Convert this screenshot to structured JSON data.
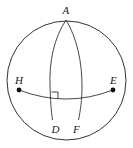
{
  "diagram": {
    "type": "spherical-geometry",
    "sphere": {
      "cx": 66.5,
      "cy": 80.5,
      "r": 59.5
    },
    "points": {
      "A": {
        "label": "A",
        "x": 66,
        "y": 20
      },
      "H": {
        "label": "H",
        "x": 19,
        "y": 90
      },
      "E": {
        "label": "E",
        "x": 113,
        "y": 90
      },
      "D": {
        "label": "D",
        "x": 52,
        "y": 120
      },
      "F": {
        "label": "F",
        "x": 78,
        "y": 120
      }
    },
    "labels": {
      "A": "A",
      "H": "H",
      "E": "E",
      "D": "D",
      "F": "F"
    },
    "arcs": [
      {
        "name": "arc-A-D",
        "from": "A",
        "to": "D"
      },
      {
        "name": "arc-A-F",
        "from": "A",
        "to": "F"
      },
      {
        "name": "arc-H-E",
        "from": "H",
        "to": "E"
      }
    ],
    "right_angle_marker": {
      "at": "intersection of AD and HE"
    },
    "colors": {
      "line": "#333333",
      "point": "#111111",
      "background": "#ffffff"
    }
  }
}
